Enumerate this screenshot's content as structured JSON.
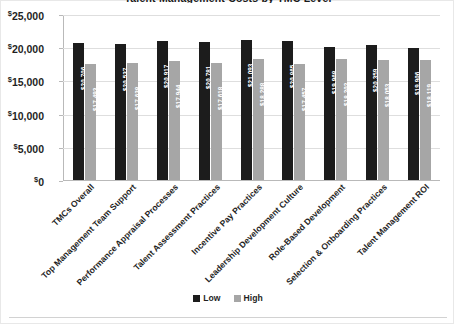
{
  "chart_data": {
    "type": "bar",
    "title": "Talent Management Costs by TMC Level",
    "xlabel": "",
    "ylabel": "",
    "ylim": [
      0,
      25000
    ],
    "ytick_labels": [
      "$25,000",
      "$20,000",
      "$15,000",
      "$10,000",
      "$5,000",
      "$0"
    ],
    "ytick_values": [
      25000,
      20000,
      15000,
      10000,
      5000,
      0
    ],
    "grid": true,
    "legend_position": "bottom",
    "categories": [
      "TMCs Overall",
      "Top Management Team Support",
      "Performance Appraisal Processes",
      "Talent Assessment Practices",
      "Incentive Pay Practices",
      "Leadership Development Culture",
      "Role-Based Development",
      "Selection & Onboarding Practices",
      "Talent Management ROI"
    ],
    "series": [
      {
        "name": "Low",
        "color": "#1c1c1c",
        "values": [
          20706,
          20537,
          20917,
          20781,
          21093,
          20865,
          19968,
          20359,
          19906
        ],
        "labels": [
          "$20,706",
          "$20,537",
          "$20,917",
          "$20,781",
          "$21,093",
          "$20,865",
          "$19,968",
          "$20,359",
          "$19,906"
        ]
      },
      {
        "name": "High",
        "color": "#a6a6a6",
        "values": [
          17493,
          17638,
          17944,
          17618,
          18288,
          17457,
          18202,
          18053,
          18119
        ],
        "labels": [
          "$17,493",
          "$17,638",
          "$17,944",
          "$17,618",
          "$18,288",
          "$17,457",
          "$18,202",
          "$18,053",
          "$18,119"
        ]
      }
    ]
  },
  "legend": {
    "items": [
      {
        "label": "Low",
        "color": "#1c1c1c"
      },
      {
        "label": "High",
        "color": "#a6a6a6"
      }
    ]
  }
}
